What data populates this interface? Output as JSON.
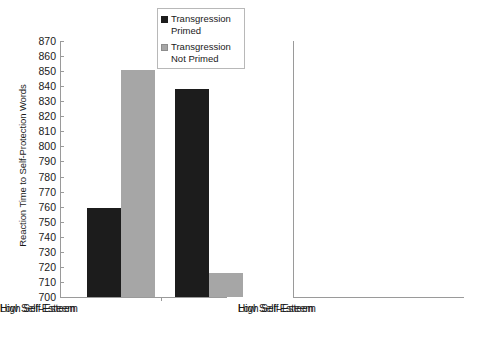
{
  "chart_data": [
    {
      "panel": "left",
      "type": "bar",
      "title": "",
      "xlabel": "",
      "ylabel": "Reaction Time to Self-Protection Words",
      "ylim": [
        700,
        870
      ],
      "ytick_step": 10,
      "yticks": [
        870,
        860,
        850,
        840,
        830,
        820,
        810,
        800,
        790,
        780,
        770,
        760,
        750,
        740,
        730,
        720,
        710,
        700
      ],
      "categories": [
        "Low Self-Esteem",
        "High Self-Esteem"
      ],
      "grid": false,
      "legend_position": "top-center",
      "series": [
        {
          "name": "Transgression Primed",
          "color": "#1c1c1c",
          "values": [
            759,
            838
          ]
        },
        {
          "name": "Transgression Not Primed",
          "color": "#a6a6a6",
          "values": [
            851,
            716
          ]
        }
      ]
    },
    {
      "panel": "right",
      "type": "bar",
      "title": "",
      "xlabel": "",
      "ylabel": "",
      "ylim": [
        700,
        870
      ],
      "ytick_step": 10,
      "yticks": [
        870,
        860,
        850,
        840,
        830,
        820,
        810,
        800,
        790,
        780,
        770,
        760,
        750,
        740,
        730,
        720,
        710,
        700
      ],
      "categories": [
        "Low Self-Esteem",
        "High Self-Esteem"
      ],
      "grid": false,
      "legend_position": "none",
      "series": [
        {
          "name": "Transgression Primed",
          "color": "#1c1c1c",
          "values": [
            840,
            728
          ]
        },
        {
          "name": "Transgression Not Primed",
          "color": "#a6a6a6",
          "values": [
            787,
            838
          ]
        }
      ]
    }
  ],
  "legend": {
    "items": [
      {
        "label_line1": "Transgression",
        "label_line2": "Primed",
        "color": "#1c1c1c"
      },
      {
        "label_line1": "Transgression",
        "label_line2": "Not Primed",
        "color": "#a6a6a6"
      }
    ]
  },
  "axis": {
    "y_title": "Reaction Time to Self-Protection Words"
  }
}
